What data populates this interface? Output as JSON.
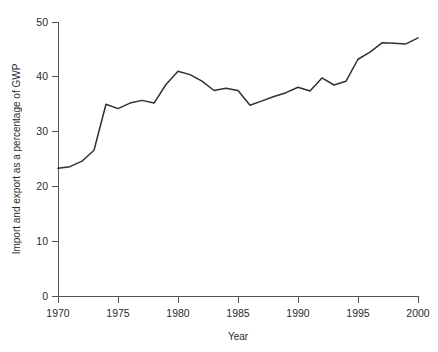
{
  "chart_data": {
    "type": "line",
    "title": "",
    "xlabel": "Year",
    "ylabel": "Import and export as a percentage of GWP",
    "xlim": [
      1970,
      2000
    ],
    "ylim": [
      0,
      50
    ],
    "grid": false,
    "legend": false,
    "line_color": "#303030",
    "axis_color": "#555555",
    "background_color": "#ffffff",
    "xticks": [
      1970,
      1975,
      1980,
      1985,
      1990,
      1995,
      2000
    ],
    "xtick_labels": [
      "1970",
      "1975",
      "1980",
      "1985",
      "1990",
      "1995",
      "2000"
    ],
    "yticks": [
      0,
      10,
      20,
      30,
      40,
      50
    ],
    "ytick_labels": [
      "0",
      "10",
      "20",
      "30",
      "40",
      "50"
    ],
    "x": [
      1970,
      1971,
      1972,
      1973,
      1974,
      1975,
      1976,
      1977,
      1978,
      1979,
      1980,
      1981,
      1982,
      1983,
      1984,
      1985,
      1986,
      1987,
      1988,
      1989,
      1990,
      1991,
      1992,
      1993,
      1994,
      1995,
      1996,
      1997,
      1998,
      1999,
      2000
    ],
    "values": [
      23.3,
      23.6,
      24.6,
      26.6,
      35.0,
      34.2,
      35.2,
      35.7,
      35.2,
      38.6,
      41.0,
      40.4,
      39.2,
      37.5,
      37.9,
      37.5,
      34.8,
      35.6,
      36.4,
      37.1,
      38.1,
      37.4,
      39.8,
      38.5,
      39.2,
      43.2,
      44.5,
      46.2,
      46.1,
      46.0,
      47.1
    ],
    "series": [
      {
        "name": "Import and export as a percentage of GWP",
        "values": [
          23.3,
          23.6,
          24.6,
          26.6,
          35.0,
          34.2,
          35.2,
          35.7,
          35.2,
          38.6,
          41.0,
          40.4,
          39.2,
          37.5,
          37.9,
          37.5,
          34.8,
          35.6,
          36.4,
          37.1,
          38.1,
          37.4,
          39.8,
          38.5,
          39.2,
          43.2,
          44.5,
          46.2,
          46.1,
          46.0,
          47.1
        ]
      }
    ]
  },
  "axes": {
    "x_axis_title": "Year",
    "y_axis_title": "Import and export as a percentage of GWP"
  }
}
